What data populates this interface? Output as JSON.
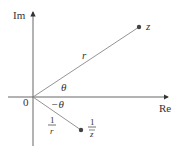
{
  "diagram": {
    "axes": {
      "vertical_label": "Im",
      "horizontal_label": "Re",
      "origin_label": "0"
    },
    "points": [
      {
        "label": "z",
        "modulus_label": "r",
        "angle_label": "θ"
      },
      {
        "label_numerator": "1",
        "label_denominator": "z",
        "label_denominator_bar": true,
        "modulus_numerator": "1",
        "modulus_denominator": "r",
        "angle_label": "−θ"
      }
    ],
    "colors": {
      "axis": "#333333",
      "ray": "#888888",
      "point": "#444444",
      "text": "#333333"
    }
  }
}
